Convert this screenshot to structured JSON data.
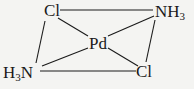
{
  "diagram": {
    "title": "",
    "center": {
      "label": "Pd"
    },
    "ligands": [
      {
        "id": "cl_top",
        "label": "Cl",
        "position": "top-left"
      },
      {
        "id": "nh3_top",
        "label": "NH",
        "sub": "3",
        "position": "top-right"
      },
      {
        "id": "h3n_bottom",
        "label_pre": "H",
        "sub": "3",
        "label_post": "N",
        "position": "bottom-left"
      },
      {
        "id": "cl_bottom",
        "label": "Cl",
        "position": "bottom-right"
      }
    ],
    "bonds": [
      [
        "cl_top",
        "nh3_top"
      ],
      [
        "cl_top",
        "h3n_bottom"
      ],
      [
        "h3n_bottom",
        "cl_bottom"
      ],
      [
        "cl_bottom",
        "nh3_top"
      ],
      [
        "cl_top",
        "Pd"
      ],
      [
        "nh3_top",
        "Pd"
      ],
      [
        "h3n_bottom",
        "Pd"
      ],
      [
        "cl_bottom",
        "Pd"
      ]
    ],
    "line_color": "#1a1a1a"
  }
}
